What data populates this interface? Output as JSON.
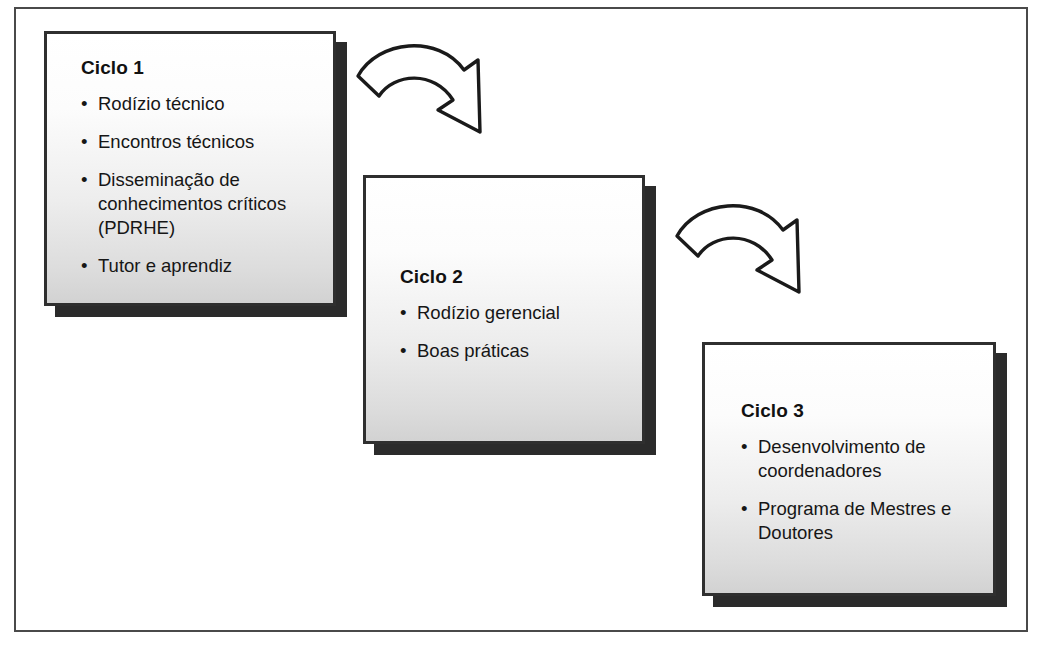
{
  "diagram": {
    "frame_border_color": "#4a4a4a",
    "box_border_color": "#2f2f2f",
    "box_shadow_color": "#2b2b2b",
    "arrow_stroke_color": "#1a1a1a",
    "arrow_fill_color": "#ffffff",
    "boxes": [
      {
        "id": "ciclo-1",
        "title": "Ciclo 1",
        "bullet_glyph": "•",
        "bullets": [
          "Rodízio técnico",
          "Encontros técnicos",
          "Disseminação de conhecimentos críticos (PDRHE)",
          "Tutor e aprendiz"
        ]
      },
      {
        "id": "ciclo-2",
        "title": "Ciclo 2",
        "bullet_glyph": "•",
        "bullets": [
          "Rodízio gerencial",
          "Boas práticas"
        ]
      },
      {
        "id": "ciclo-3",
        "title": "Ciclo 3",
        "bullet_glyph": "•",
        "bullets": [
          "Desenvolvimento de coordenadores",
          "Programa de Mestres e Doutores"
        ]
      }
    ],
    "arrows": [
      {
        "id": "arrow-ciclo1-to-ciclo2",
        "from": "Ciclo 1",
        "to": "Ciclo 2",
        "shape": "curved-down-right"
      },
      {
        "id": "arrow-ciclo2-to-ciclo3",
        "from": "Ciclo 2",
        "to": "Ciclo 3",
        "shape": "curved-down-right"
      }
    ]
  }
}
